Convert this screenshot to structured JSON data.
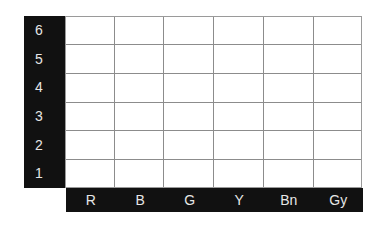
{
  "grid": {
    "rows": [
      "6",
      "5",
      "4",
      "3",
      "2",
      "1"
    ],
    "columns": [
      "R",
      "B",
      "G",
      "Y",
      "Bn",
      "Gy"
    ],
    "header_color": "#111111",
    "label_color": "#e6e6e6",
    "line_color": "#8c8c8c"
  }
}
